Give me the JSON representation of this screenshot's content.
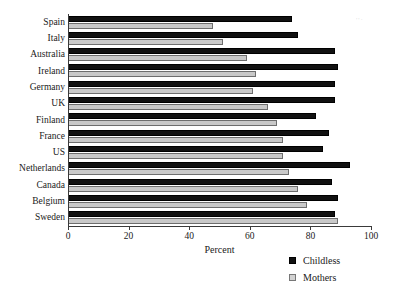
{
  "chart_data": {
    "type": "bar",
    "orientation": "horizontal",
    "title": "",
    "xlabel": "Percent",
    "ylabel": "",
    "xlim": [
      0,
      100
    ],
    "xticks": [
      0,
      20,
      40,
      60,
      80,
      100
    ],
    "grid": false,
    "legend_position": "bottom-right",
    "categories": [
      "Spain",
      "Italy",
      "Australia",
      "Ireland",
      "Germany",
      "UK",
      "Finland",
      "France",
      "US",
      "Netherlands",
      "Canada",
      "Belgium",
      "Sweden"
    ],
    "series": [
      {
        "name": "Childless",
        "color": "#111111",
        "values": [
          74,
          76,
          88,
          89,
          88,
          88,
          82,
          86,
          84,
          93,
          87,
          89,
          88
        ]
      },
      {
        "name": "Mothers",
        "color": "#c9c9c9",
        "values": [
          48,
          51,
          59,
          62,
          61,
          66,
          69,
          71,
          71,
          73,
          76,
          79,
          89
        ]
      }
    ]
  },
  "legend": {
    "entries": [
      {
        "label": "Childless",
        "swatch": "black-square-icon"
      },
      {
        "label": "Mothers",
        "swatch": "grey-square-icon"
      }
    ]
  },
  "axis": {
    "x_title": "Percent",
    "tick_labels": [
      "0",
      "20",
      "40",
      "60",
      "80",
      "100"
    ]
  }
}
